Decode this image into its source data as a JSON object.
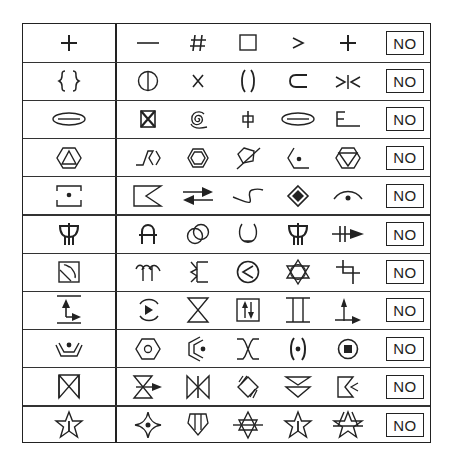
{
  "table": {
    "answer_label": "NO",
    "rows": [
      {
        "ref": "plus",
        "options": [
          "dash",
          "hash",
          "square",
          "greater-than",
          "plus"
        ]
      },
      {
        "ref": "curly-braces",
        "options": [
          "circle-vertical-line",
          "x-letter",
          "parentheses",
          "subset",
          "bowtie-bar"
        ]
      },
      {
        "ref": "ellipse-bar",
        "options": [
          "boxed-x",
          "spiral",
          "phi-like",
          "ellipse-bar",
          "e-underline"
        ]
      },
      {
        "ref": "hexagon-triangle",
        "options": [
          "zigzag-chevron",
          "double-hexagon",
          "pentagon-slash",
          "half-hexagon-dot",
          "hexagon-inverted-triangle"
        ]
      },
      {
        "ref": "dot-in-bracket-box",
        "options": [
          "flag-notch",
          "opposing-arrows",
          "s-curve",
          "diamond-in-diamond",
          "arc-dot"
        ]
      },
      {
        "ref": "trident-cup",
        "options": [
          "arch-bar",
          "overlapping-circles",
          "open-cup",
          "trident-cup",
          "double-bar-arrow"
        ]
      },
      {
        "ref": "boxed-squiggle",
        "options": [
          "double-arc-stem",
          "bracket-twist",
          "circle-less-than",
          "star-of-david-circle",
          "offset-cross"
        ]
      },
      {
        "ref": "bar-arrows-base",
        "options": [
          "circle-play",
          "hourglass",
          "boxed-updown-arrows",
          "i-beam",
          "up-right-arrows"
        ]
      },
      {
        "ref": "tray-dot",
        "options": [
          "hexagon-circle",
          "double-chevron-dot",
          "x-crossed-arcs",
          "parenthesized-dot",
          "circled-square"
        ]
      },
      {
        "ref": "bowtie-box",
        "options": [
          "hourglass-arrow",
          "bowtie-bar-vertical",
          "crossed-diamond",
          "double-down-triangle",
          "flag-double-chevron"
        ]
      },
      {
        "ref": "star-line",
        "options": [
          "four-point-star-dot",
          "shield-lines",
          "star-of-david-bar",
          "star-line",
          "star-crossbar"
        ]
      }
    ]
  }
}
